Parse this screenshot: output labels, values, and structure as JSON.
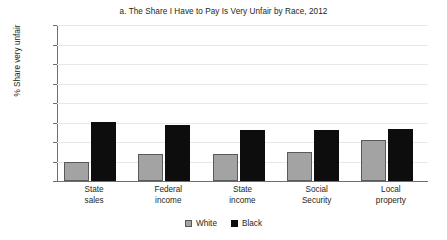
{
  "chart_data": {
    "type": "bar",
    "title": "a. The Share I Have to Pay Is Very Unfair by Race, 2012",
    "xlabel": "",
    "ylabel": "% Share very unfair",
    "categories": [
      "State sales",
      "Federal income",
      "State income",
      "Social Security",
      "Local property"
    ],
    "category_lines": [
      [
        "State",
        "sales"
      ],
      [
        "Federal",
        "income"
      ],
      [
        "State",
        "income"
      ],
      [
        "Social",
        "Security"
      ],
      [
        "Local",
        "property"
      ]
    ],
    "series": [
      {
        "name": "White",
        "color": "#a3a3a3",
        "values": [
          9.5,
          14,
          14,
          15,
          21
        ]
      },
      {
        "name": "Black",
        "color": "#0d0d0d",
        "values": [
          30.5,
          28.5,
          26,
          26,
          26.5
        ]
      }
    ],
    "ylim": [
      0,
      80
    ],
    "ytick_labels": [
      "80",
      "70",
      "60",
      "50",
      "40",
      "30",
      "20",
      "10",
      "0"
    ],
    "ytick_values": [
      80,
      70,
      60,
      50,
      40,
      30,
      20,
      10,
      0
    ],
    "grid": true,
    "legend_position": "bottom-center"
  }
}
